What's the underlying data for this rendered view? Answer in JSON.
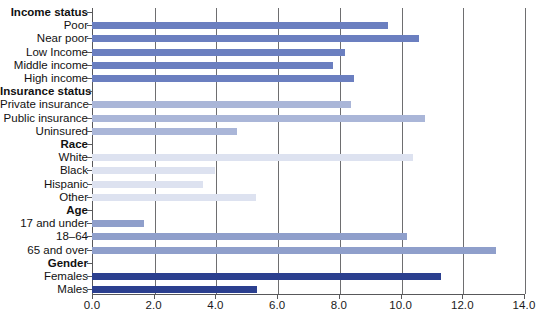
{
  "chart_data": {
    "type": "bar",
    "orientation": "horizontal",
    "title": "",
    "xlabel": "",
    "ylabel": "",
    "xlim": [
      0.0,
      14.0
    ],
    "xticks": [
      "0.0",
      "2.0",
      "4.0",
      "6.0",
      "8.0",
      "10.0",
      "12.0",
      "14.0"
    ],
    "xtick_values": [
      0.0,
      2.0,
      4.0,
      6.0,
      8.0,
      10.0,
      12.0,
      14.0
    ],
    "grid": true,
    "legend": "none",
    "groups": [
      {
        "name": "Income status",
        "color": "#6b7fc0",
        "categories": [
          "Poor",
          "Near poor",
          "Low Income",
          "Middle income",
          "High income"
        ],
        "values": [
          9.6,
          10.6,
          8.2,
          7.8,
          8.5
        ]
      },
      {
        "name": "Insurance status",
        "color": "#aab6d8",
        "categories": [
          "Private insurance",
          "Public insurance",
          "Uninsured"
        ],
        "values": [
          8.4,
          10.8,
          4.7
        ]
      },
      {
        "name": "Race",
        "color": "#dde2f0",
        "categories": [
          "White",
          "Black",
          "Hispanic",
          "Other"
        ],
        "values": [
          10.4,
          4.0,
          3.6,
          5.3
        ]
      },
      {
        "name": "Age",
        "color": "#8f9fcb",
        "categories": [
          "17 and under",
          "18–64",
          "65 and over"
        ],
        "values": [
          1.7,
          10.2,
          13.1
        ]
      },
      {
        "name": "Gender",
        "color": "#2b3f8f",
        "categories": [
          "Females",
          "Males"
        ],
        "values": [
          11.3,
          5.35
        ]
      }
    ],
    "colors": {
      "income": "#6b7fc0",
      "insurance": "#aab6d8",
      "race": "#dde2f0",
      "age": "#8f9fcb",
      "gender": "#2b3f8f",
      "axis": "#58585a",
      "grid": "#6e6e70",
      "text": "#111111"
    }
  }
}
